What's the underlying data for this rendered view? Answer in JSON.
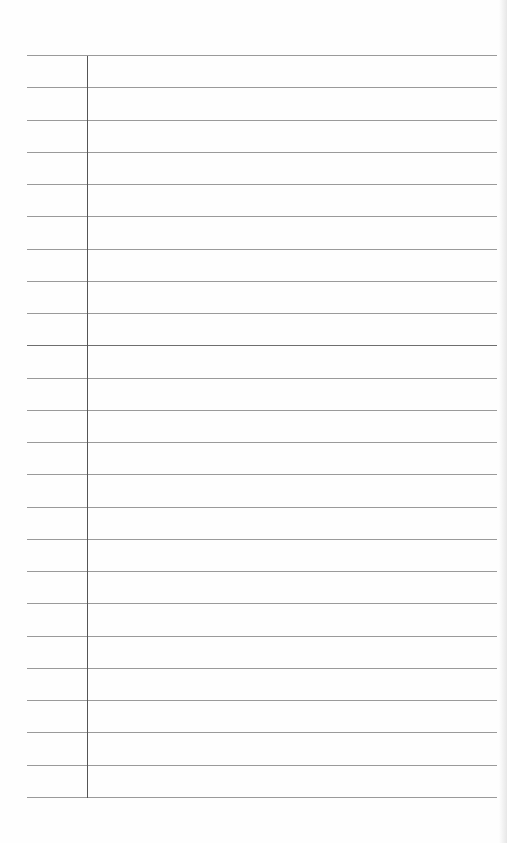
{
  "document": {
    "type": "ruled-paper",
    "rule_count": 24,
    "first_rule_y": 55,
    "rule_spacing": 32.26,
    "rule_left_x": 27,
    "rule_right_x": 497,
    "margin_line_x": 87,
    "highlighted_rule_index": 9,
    "colors": {
      "paper": "#fefefe",
      "rule": "#9a9a9a",
      "rule_dark": "#6e6e6e",
      "margin": "#555555"
    }
  }
}
